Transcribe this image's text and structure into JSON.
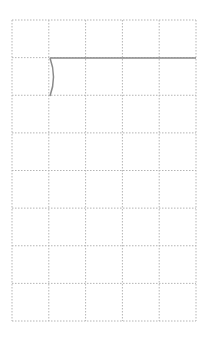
{
  "grid": {
    "left": 12,
    "top": 20,
    "right": 196,
    "bottom": 321,
    "columns": 5,
    "rows": 8,
    "line_color": "#b5b5b5",
    "dash": "1.5 1.5"
  },
  "strokes": {
    "color": "#8a8a8a",
    "horizontal_line": {
      "x1": 50,
      "y1": 58,
      "x2": 196,
      "y2": 58
    },
    "curve": {
      "start": [
        50,
        58
      ],
      "control": [
        57,
        77
      ],
      "end": [
        50,
        96
      ]
    }
  }
}
